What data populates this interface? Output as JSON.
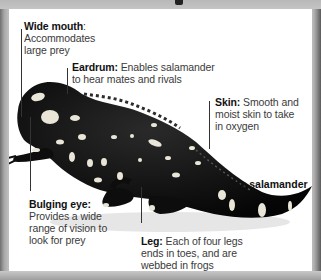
{
  "diagram": {
    "subject": "fire salamander",
    "colors": {
      "panel_bg": "#ffffff",
      "frame": "#b9b9b9",
      "body": "#0f0f0f",
      "spots": "#e9e6d8",
      "text": "#3a3a3a",
      "heading": "#111111"
    },
    "labels": [
      {
        "term": "Wide mouth",
        "sep": ":",
        "desc_lines": [
          "Accommodates",
          "large prey"
        ]
      },
      {
        "term": "Eardrum:",
        "desc_lines": [
          "Enables salamander",
          "to hear mates and rivals"
        ]
      },
      {
        "term": "Skin:",
        "desc_lines": [
          "Smooth and",
          "moist skin to take",
          "in oxygen"
        ]
      },
      {
        "term": "Bulging eye:",
        "desc_lines": [
          "Provides a wide",
          "range of vision to",
          "look for prey"
        ]
      },
      {
        "term": "Leg:",
        "desc_lines": [
          "Each of four legs",
          "ends in toes, and are",
          "webbed in frogs"
        ]
      }
    ]
  }
}
